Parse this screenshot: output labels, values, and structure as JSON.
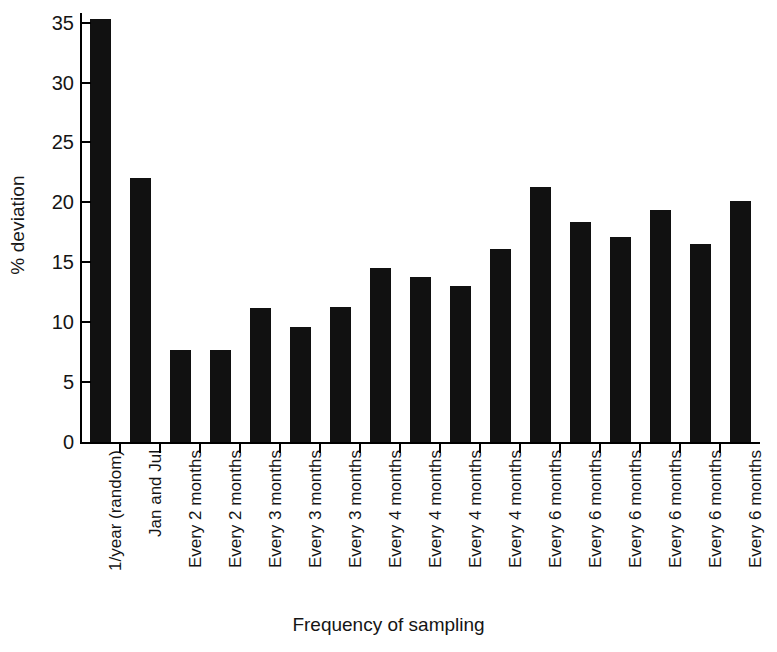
{
  "chart_data": {
    "type": "bar",
    "title": "",
    "xlabel": "Frequency of sampling",
    "ylabel": "% deviation",
    "ylim": [
      0,
      35.8
    ],
    "yticks": [
      0,
      5,
      10,
      15,
      20,
      25,
      30,
      35
    ],
    "ytick_labels": [
      "0",
      "5",
      "10",
      "15",
      "20",
      "25",
      "30",
      "35"
    ],
    "grid": false,
    "legend": null,
    "bar_color": "#111111",
    "categories": [
      "1/year (random)",
      "Jan and Jul",
      "Every 2 months",
      "Every 2 months",
      "Every 3 months",
      "Every 3 months",
      "Every 3 months",
      "Every 4 months",
      "Every 4 months",
      "Every 4 months",
      "Every 4 months",
      "Every 6 months",
      "Every 6 months",
      "Every 6 months",
      "Every 6 months",
      "Every 6 months",
      "Every 6 months"
    ],
    "values": [
      35.3,
      22.0,
      7.7,
      7.7,
      11.2,
      9.6,
      11.3,
      14.5,
      13.8,
      13.0,
      16.1,
      21.3,
      18.4,
      17.1,
      19.4,
      16.5,
      20.1
    ]
  }
}
